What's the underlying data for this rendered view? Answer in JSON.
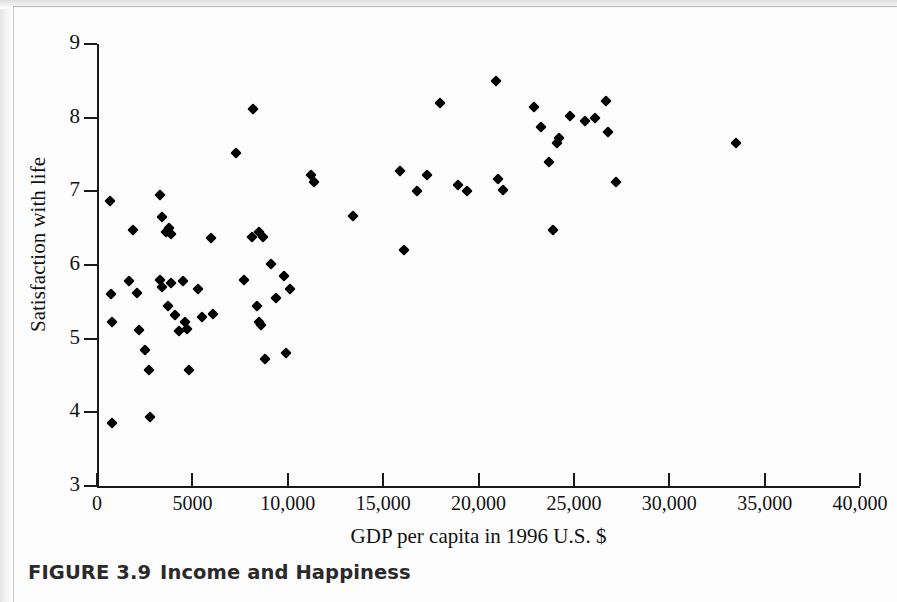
{
  "figure": {
    "caption_prefix": "FIGURE 3.9",
    "caption_title": "Income and Happiness"
  },
  "chart_data": {
    "type": "scatter",
    "title": "Income and Happiness",
    "xlabel": "GDP per capita in 1996 U.S. $",
    "ylabel": "Satisfaction with life",
    "xlim": [
      0,
      40000
    ],
    "ylim": [
      3,
      9
    ],
    "grid": false,
    "legend": null,
    "marker": "diamond",
    "marker_color": "#000000",
    "x_ticks": [
      0,
      5000,
      10000,
      15000,
      20000,
      25000,
      30000,
      35000,
      40000
    ],
    "x_tick_labels": [
      "0",
      "5000",
      "10,000",
      "15,000",
      "20,000",
      "25,000",
      "30,000",
      "35,000",
      "40,000"
    ],
    "y_ticks": [
      3,
      4,
      5,
      6,
      7,
      8,
      9
    ],
    "y_tick_labels": [
      "3",
      "4",
      "5",
      "6",
      "7",
      "8",
      "9"
    ],
    "points": [
      {
        "x": 700,
        "y": 6.87
      },
      {
        "x": 750,
        "y": 5.6
      },
      {
        "x": 800,
        "y": 5.22
      },
      {
        "x": 800,
        "y": 3.85
      },
      {
        "x": 1700,
        "y": 5.78
      },
      {
        "x": 1900,
        "y": 6.48
      },
      {
        "x": 2100,
        "y": 5.62
      },
      {
        "x": 2200,
        "y": 5.12
      },
      {
        "x": 2500,
        "y": 4.85
      },
      {
        "x": 2700,
        "y": 4.57
      },
      {
        "x": 2800,
        "y": 3.93
      },
      {
        "x": 3300,
        "y": 6.95
      },
      {
        "x": 3300,
        "y": 5.8
      },
      {
        "x": 3400,
        "y": 5.7
      },
      {
        "x": 3400,
        "y": 6.65
      },
      {
        "x": 3600,
        "y": 6.45
      },
      {
        "x": 3700,
        "y": 5.45
      },
      {
        "x": 3800,
        "y": 6.5
      },
      {
        "x": 3900,
        "y": 6.42
      },
      {
        "x": 3900,
        "y": 5.75
      },
      {
        "x": 4100,
        "y": 5.32
      },
      {
        "x": 4300,
        "y": 5.1
      },
      {
        "x": 4500,
        "y": 5.78
      },
      {
        "x": 4600,
        "y": 5.22
      },
      {
        "x": 4700,
        "y": 5.13
      },
      {
        "x": 4800,
        "y": 4.57
      },
      {
        "x": 5300,
        "y": 5.68
      },
      {
        "x": 5500,
        "y": 5.3
      },
      {
        "x": 6000,
        "y": 6.37
      },
      {
        "x": 6100,
        "y": 5.33
      },
      {
        "x": 7300,
        "y": 7.52
      },
      {
        "x": 7700,
        "y": 5.8
      },
      {
        "x": 8100,
        "y": 6.38
      },
      {
        "x": 8200,
        "y": 8.12
      },
      {
        "x": 8400,
        "y": 5.45
      },
      {
        "x": 8500,
        "y": 6.45
      },
      {
        "x": 8500,
        "y": 5.22
      },
      {
        "x": 8600,
        "y": 5.18
      },
      {
        "x": 8700,
        "y": 6.38
      },
      {
        "x": 8800,
        "y": 4.73
      },
      {
        "x": 9100,
        "y": 6.02
      },
      {
        "x": 9400,
        "y": 5.55
      },
      {
        "x": 9800,
        "y": 5.85
      },
      {
        "x": 9900,
        "y": 4.8
      },
      {
        "x": 10100,
        "y": 5.68
      },
      {
        "x": 11200,
        "y": 7.22
      },
      {
        "x": 11400,
        "y": 7.12
      },
      {
        "x": 13400,
        "y": 6.67
      },
      {
        "x": 15900,
        "y": 7.27
      },
      {
        "x": 16100,
        "y": 6.2
      },
      {
        "x": 16800,
        "y": 7.0
      },
      {
        "x": 17300,
        "y": 7.22
      },
      {
        "x": 18000,
        "y": 8.2
      },
      {
        "x": 18900,
        "y": 7.08
      },
      {
        "x": 19400,
        "y": 7.0
      },
      {
        "x": 20900,
        "y": 8.5
      },
      {
        "x": 21000,
        "y": 7.17
      },
      {
        "x": 21300,
        "y": 7.02
      },
      {
        "x": 22900,
        "y": 8.15
      },
      {
        "x": 23300,
        "y": 7.87
      },
      {
        "x": 23700,
        "y": 7.4
      },
      {
        "x": 23900,
        "y": 6.47
      },
      {
        "x": 24100,
        "y": 7.65
      },
      {
        "x": 24200,
        "y": 7.72
      },
      {
        "x": 24800,
        "y": 8.02
      },
      {
        "x": 25600,
        "y": 7.95
      },
      {
        "x": 26100,
        "y": 8.0
      },
      {
        "x": 26700,
        "y": 8.22
      },
      {
        "x": 26800,
        "y": 7.8
      },
      {
        "x": 27200,
        "y": 7.12
      },
      {
        "x": 33500,
        "y": 7.65
      }
    ]
  }
}
